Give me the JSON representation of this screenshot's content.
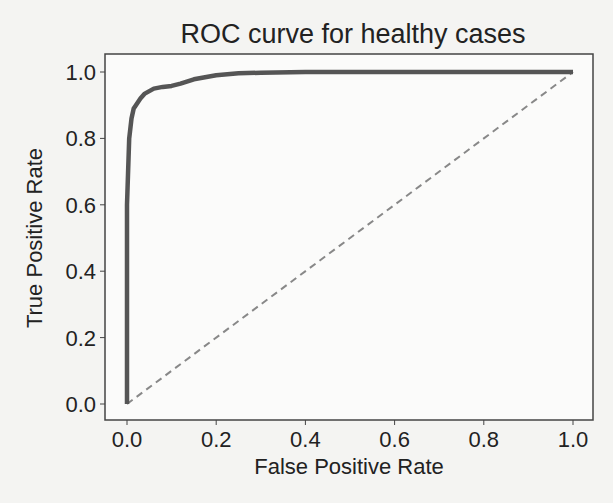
{
  "chart_data": {
    "type": "line",
    "title": "ROC curve for healthy cases",
    "xlabel": "False Positive Rate",
    "ylabel": "True Positive Rate",
    "xlim": [
      -0.05,
      1.05
    ],
    "ylim": [
      -0.05,
      1.05
    ],
    "xticks": [
      "0.0",
      "0.2",
      "0.4",
      "0.6",
      "0.8",
      "1.0"
    ],
    "yticks": [
      "0.0",
      "0.2",
      "0.4",
      "0.6",
      "0.8",
      "1.0"
    ],
    "grid": false,
    "legend": null,
    "series": [
      {
        "name": "ROC",
        "style": "solid",
        "color": "#555555",
        "x": [
          0.0,
          0.0,
          0.005,
          0.01,
          0.015,
          0.02,
          0.03,
          0.04,
          0.06,
          0.08,
          0.1,
          0.12,
          0.15,
          0.2,
          0.25,
          0.3,
          0.4,
          0.6,
          0.8,
          1.0
        ],
        "y": [
          0.0,
          0.6,
          0.8,
          0.86,
          0.89,
          0.9,
          0.92,
          0.935,
          0.95,
          0.955,
          0.958,
          0.965,
          0.978,
          0.99,
          0.996,
          0.998,
          1.0,
          1.0,
          1.0,
          1.0
        ]
      },
      {
        "name": "chance",
        "style": "dashed",
        "color": "#888888",
        "x": [
          0.0,
          1.0
        ],
        "y": [
          0.0,
          1.0
        ]
      }
    ]
  }
}
